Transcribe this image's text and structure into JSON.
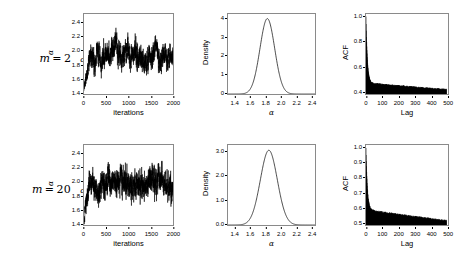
{
  "figure": {
    "rows": [
      {
        "label_prefix": "m",
        "label_eq": "=",
        "label_value": "2",
        "label_param": "α"
      },
      {
        "label_prefix": "m",
        "label_eq": "=",
        "label_value": "20",
        "label_param": "α"
      }
    ]
  },
  "chart_data": [
    {
      "type": "line",
      "panel": "trace",
      "row": "m = 2",
      "title": "",
      "xlabel": "iterations",
      "ylabel": "α",
      "xlim": [
        0,
        2000
      ],
      "ylim": [
        1.3,
        2.45
      ],
      "xticks": [
        0,
        500,
        1000,
        1500,
        2000
      ],
      "xtick_labels": [
        "0",
        "500",
        "1000",
        "1500",
        "2000"
      ],
      "yticks": [
        1.4,
        1.6,
        1.8,
        2.0,
        2.2,
        2.4
      ],
      "ytick_labels": [
        "1.4",
        "1.6",
        "1.8",
        "2.0",
        "2.2",
        "2.4"
      ],
      "grid": false,
      "legend": null,
      "description": "MCMC trace of alpha over 2000 iterations; burn-in rises from about 1.35 to a stationary band centred near 1.85 with spread roughly 1.60 to 2.10.",
      "series": [
        {
          "name": "alpha trace",
          "color": "#000000",
          "burn_in_start": 1.35,
          "stationary_mean": 1.85,
          "stationary_sd": 0.105,
          "burn_in_length": 260,
          "n": 2000
        }
      ]
    },
    {
      "type": "line",
      "panel": "density",
      "row": "m = 2",
      "title": "",
      "xlabel": "α",
      "ylabel": "Density",
      "xlim": [
        1.3,
        2.45
      ],
      "ylim": [
        0,
        4.35
      ],
      "xticks": [
        1.4,
        1.6,
        1.8,
        2.0,
        2.2,
        2.4
      ],
      "xtick_labels": [
        "1.4",
        "1.6",
        "1.8",
        "2.0",
        "2.2",
        "2.4"
      ],
      "yticks": [
        0,
        1,
        2,
        3,
        4
      ],
      "ytick_labels": [
        "0",
        "1",
        "2",
        "3",
        "4"
      ],
      "grid": false,
      "legend": null,
      "description": "Unimodal kernel density of alpha peaking at about 4.1 near alpha = 1.82.",
      "series": [
        {
          "name": "posterior density",
          "color": "#000000",
          "peak_x": 1.82,
          "peak_y": 4.1,
          "sd": 0.097
        }
      ]
    },
    {
      "type": "area",
      "panel": "acf",
      "row": "m = 2",
      "title": "",
      "xlabel": "Lag",
      "ylabel": "ACF",
      "xlim": [
        0,
        510
      ],
      "ylim": [
        0.38,
        1.02
      ],
      "xticks": [
        0,
        100,
        200,
        300,
        400,
        500
      ],
      "xtick_labels": [
        "0",
        "100",
        "200",
        "300",
        "400",
        "500"
      ],
      "yticks": [
        0.4,
        0.6,
        0.8,
        1.0
      ],
      "ytick_labels": [
        "0.4",
        "0.6",
        "0.8",
        "1.0"
      ],
      "grid": false,
      "legend": null,
      "description": "Autocorrelation spikes from 1.0 at lag 0, falling steeply to about 0.47 by lag 25 then decaying slowly to about 0.42 at lag 500.",
      "series": [
        {
          "name": "ACF",
          "color": "#000000",
          "value_at_lag0": 1.0,
          "value_at_lag25": 0.47,
          "value_at_lag100": 0.455,
          "value_at_lag300": 0.435,
          "value_at_lag500": 0.415,
          "fast_decay_rate": 0.12
        }
      ]
    },
    {
      "type": "line",
      "panel": "trace",
      "row": "m = 20",
      "title": "",
      "xlabel": "iterations",
      "ylabel": "α",
      "xlim": [
        0,
        2000
      ],
      "ylim": [
        1.3,
        2.45
      ],
      "xticks": [
        0,
        500,
        1000,
        1500,
        2000
      ],
      "xtick_labels": [
        "0",
        "500",
        "1000",
        "1500",
        "2000"
      ],
      "yticks": [
        1.4,
        1.6,
        1.8,
        2.0,
        2.2,
        2.4
      ],
      "ytick_labels": [
        "1.4",
        "1.6",
        "1.8",
        "2.0",
        "2.2",
        "2.4"
      ],
      "grid": false,
      "legend": null,
      "description": "MCMC trace of alpha over 2000 iterations; rises from about 1.32 and mixes around 1.86 with visible slow excursions up to 2.30.",
      "series": [
        {
          "name": "alpha trace",
          "color": "#000000",
          "burn_in_start": 1.32,
          "stationary_mean": 1.86,
          "stationary_sd": 0.12,
          "burn_in_length": 180,
          "n": 2000
        }
      ]
    },
    {
      "type": "line",
      "panel": "density",
      "row": "m = 20",
      "title": "",
      "xlabel": "α",
      "ylabel": "Density",
      "xlim": [
        1.3,
        2.45
      ],
      "ylim": [
        0,
        3.8
      ],
      "xticks": [
        1.4,
        1.6,
        1.8,
        2.0,
        2.2,
        2.4
      ],
      "xtick_labels": [
        "1.4",
        "1.6",
        "1.8",
        "2.0",
        "2.2",
        "2.4"
      ],
      "yticks": [
        0.0,
        1.0,
        2.0,
        3.0
      ],
      "ytick_labels": [
        "0.0",
        "1.0",
        "2.0",
        "3.0"
      ],
      "grid": false,
      "legend": null,
      "description": "Unimodal kernel density of alpha peaking at about 3.55 near alpha = 1.84, slightly wider than the m = 2 case.",
      "series": [
        {
          "name": "posterior density",
          "color": "#000000",
          "peak_x": 1.84,
          "peak_y": 3.55,
          "sd": 0.112
        }
      ]
    },
    {
      "type": "area",
      "panel": "acf",
      "row": "m = 20",
      "title": "",
      "xlabel": "Lag",
      "ylabel": "ACF",
      "xlim": [
        0,
        510
      ],
      "ylim": [
        0.48,
        1.02
      ],
      "xticks": [
        0,
        100,
        200,
        300,
        400,
        500
      ],
      "xtick_labels": [
        "0",
        "100",
        "200",
        "300",
        "400",
        "500"
      ],
      "yticks": [
        0.5,
        0.6,
        0.7,
        0.8,
        0.9,
        1.0
      ],
      "ytick_labels": [
        "0.5",
        "0.6",
        "0.7",
        "0.8",
        "0.9",
        "1.0"
      ],
      "grid": false,
      "legend": null,
      "description": "Autocorrelation spikes from 1.0 at lag 0, falling steeply to about 0.58 by lag 25 then decaying slowly to about 0.51 at lag 500.",
      "series": [
        {
          "name": "ACF",
          "color": "#000000",
          "value_at_lag0": 1.0,
          "value_at_lag25": 0.585,
          "value_at_lag100": 0.565,
          "value_at_lag300": 0.535,
          "value_at_lag500": 0.508,
          "fast_decay_rate": 0.12
        }
      ]
    }
  ]
}
